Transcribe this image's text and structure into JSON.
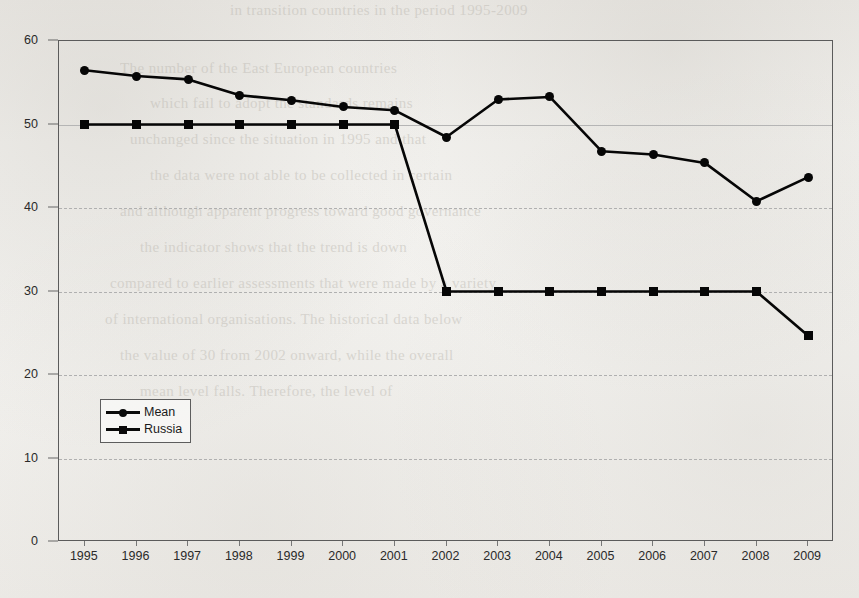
{
  "page": {
    "background_color": "#f2f1ee",
    "bleed_through_text": [
      "in transition countries in the period 1995-2009",
      "The number of the East European countries",
      "which fail to adopt the standards remains",
      "unchanged since the situation in 1995 and that",
      "the data were not able to be collected in certain",
      "and although apparent progress toward good governance",
      "the indicator shows that the trend is down",
      "compared to earlier assessments that were made by a variety",
      "of international organisations. The historical data below",
      "the value of 30 from 2002 onward, while the overall",
      "mean level falls. Therefore, the level of"
    ]
  },
  "chart_data": {
    "type": "line",
    "title": "",
    "xlabel": "",
    "ylabel": "",
    "categories": [
      "1995",
      "1996",
      "1997",
      "1998",
      "1999",
      "2000",
      "2001",
      "2002",
      "2003",
      "2004",
      "2005",
      "2006",
      "2007",
      "2008",
      "2009"
    ],
    "series": [
      {
        "name": "Mean",
        "marker": "circle",
        "color": "#060606",
        "values": [
          56.5,
          55.8,
          55.4,
          53.5,
          52.9,
          52.1,
          51.7,
          48.5,
          53.0,
          53.3,
          46.8,
          46.4,
          45.4,
          40.8,
          43.7
        ]
      },
      {
        "name": "Russia",
        "marker": "square",
        "color": "#060606",
        "values": [
          50.0,
          50.0,
          50.0,
          50.0,
          50.0,
          50.0,
          50.0,
          30.0,
          30.0,
          30.0,
          30.0,
          30.0,
          30.0,
          30.0,
          24.7
        ]
      }
    ],
    "ylim": [
      0,
      60
    ],
    "yticks": [
      0,
      10,
      20,
      30,
      40,
      50,
      60
    ],
    "ytick_labels": [
      "0",
      "10",
      "20",
      "30",
      "40",
      "50",
      "60"
    ],
    "grid": true,
    "grid_style": "dashed",
    "legend_position": "inside-lower-left",
    "frame": true
  },
  "legend": {
    "entries": [
      {
        "label": "Mean",
        "marker": "circle-marker"
      },
      {
        "label": "Russia",
        "marker": "square-marker"
      }
    ]
  }
}
